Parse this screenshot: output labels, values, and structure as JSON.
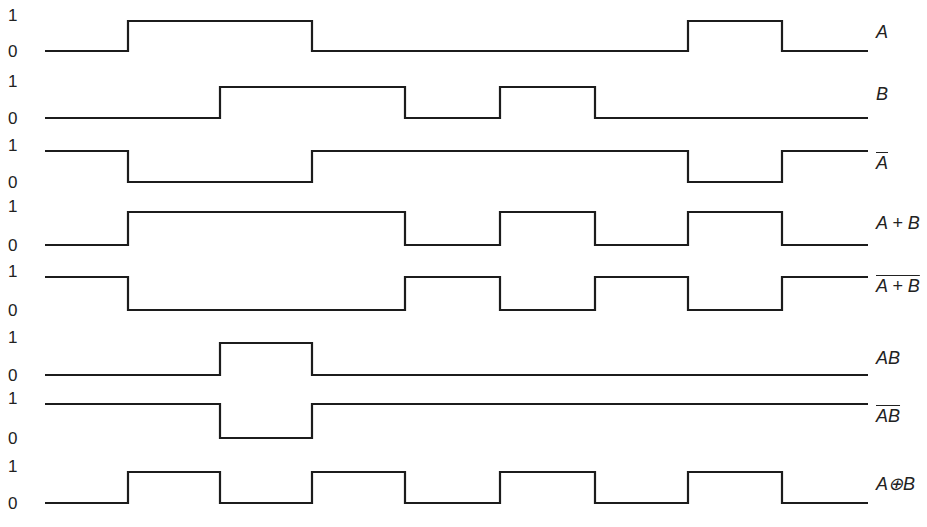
{
  "diagram": {
    "time_edges_x": [
      45,
      128,
      220,
      312,
      405,
      500,
      595,
      688,
      782,
      868
    ],
    "level_labels": {
      "high": "1",
      "low": "0"
    },
    "signals": [
      {
        "id": "A",
        "label": "A",
        "overline": false,
        "y_high": 21,
        "y_low": 51,
        "label_y": 32,
        "values": [
          0,
          1,
          1,
          0,
          0,
          0,
          0,
          1,
          0
        ]
      },
      {
        "id": "B",
        "label": "B",
        "overline": false,
        "y_high": 87,
        "y_low": 118,
        "label_y": 94,
        "values": [
          0,
          0,
          1,
          1,
          0,
          1,
          0,
          0,
          0
        ]
      },
      {
        "id": "not-A",
        "label": "A",
        "overline": true,
        "y_high": 151,
        "y_low": 182,
        "label_y": 163,
        "values": [
          1,
          0,
          0,
          1,
          1,
          1,
          1,
          0,
          1
        ]
      },
      {
        "id": "A-or-B",
        "label": "A + B",
        "overline": false,
        "y_high": 212,
        "y_low": 245,
        "label_y": 223,
        "values": [
          0,
          1,
          1,
          1,
          0,
          1,
          0,
          1,
          0
        ]
      },
      {
        "id": "A-nor-B",
        "label": "A + B",
        "overline": true,
        "y_high": 277,
        "y_low": 310,
        "label_y": 286,
        "values": [
          1,
          0,
          0,
          0,
          1,
          0,
          1,
          0,
          1
        ]
      },
      {
        "id": "A-and-B",
        "label": "AB",
        "overline": false,
        "y_high": 343,
        "y_low": 375,
        "label_y": 358,
        "values": [
          0,
          0,
          1,
          0,
          0,
          0,
          0,
          0,
          0
        ]
      },
      {
        "id": "A-nand-B",
        "label": "AB",
        "overline": true,
        "y_high": 404,
        "y_low": 438,
        "label_y": 416,
        "values": [
          1,
          1,
          0,
          1,
          1,
          1,
          1,
          1,
          1
        ]
      },
      {
        "id": "A-xor-B",
        "label": "A⊕B",
        "overline": false,
        "y_high": 472,
        "y_low": 503,
        "label_y": 484,
        "values": [
          0,
          1,
          0,
          1,
          0,
          1,
          0,
          1,
          0
        ]
      }
    ]
  }
}
